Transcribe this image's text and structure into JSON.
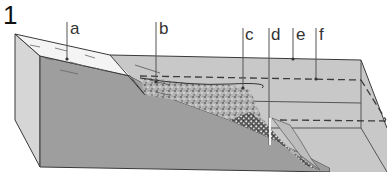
{
  "figure": {
    "number": "1",
    "type": "block diagram"
  },
  "labels": [
    {
      "id": "a",
      "text": "a",
      "x": 72,
      "pointer": [
        67,
        59
      ]
    },
    {
      "id": "b",
      "text": "b",
      "x": 161,
      "pointer": [
        156,
        82
      ]
    },
    {
      "id": "c",
      "text": "c",
      "x": 247,
      "pointer": [
        243,
        88
      ]
    },
    {
      "id": "d",
      "text": "d",
      "x": 272,
      "pointer": [
        269,
        145
      ]
    },
    {
      "id": "e",
      "text": "e",
      "x": 298,
      "pointer": [
        293,
        59
      ]
    },
    {
      "id": "f",
      "text": "f",
      "x": 321,
      "pointer": [
        316,
        79
      ]
    }
  ],
  "colors": {
    "outline": "#3a3a3a",
    "front_face": "#9e9e9e",
    "left_face": "#d6d6d6",
    "water": "#c8c8c8",
    "shore_land": "#f4f4f4",
    "sediment_dark": "#6a6a6a",
    "label_text": "#333333"
  }
}
